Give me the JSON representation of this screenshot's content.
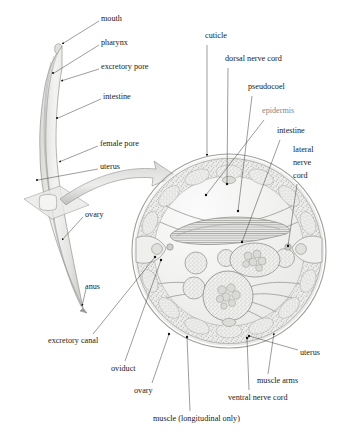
{
  "figure": {
    "background_color": "#ffffff",
    "ink_color": "#1a1a1a",
    "tissue_fill": "#e8e8e6",
    "tissue_stroke": "#9a9a98",
    "pale_fill": "#f2f2f0"
  },
  "whole_worm": {
    "name": "female-nematode-whole-body",
    "cut_plane_label": "transverse cut plane",
    "labels": [
      {
        "id": "mouth",
        "text": "mouth",
        "x": 101,
        "y": 19,
        "anchor": "start",
        "tip_x": 58,
        "tip_y": 47,
        "arrow": true
      },
      {
        "id": "pharynx",
        "text": "pharynx",
        "x": 101,
        "y": 43,
        "anchor": "start",
        "tip_x": 53,
        "tip_y": 74,
        "arrow": false
      },
      {
        "id": "excretory-pore",
        "text": "excretory pore",
        "x": 101,
        "y": 67,
        "anchor": "start",
        "tip_x": 58,
        "tip_y": 82,
        "arrow": true
      },
      {
        "id": "intestine",
        "text": "intestine",
        "x": 103,
        "y": 97,
        "anchor": "start",
        "tip_x": 57,
        "tip_y": 117,
        "arrow": false
      },
      {
        "id": "female-pore",
        "text": "female pore",
        "x": 100,
        "y": 144,
        "anchor": "start",
        "tip_x": 56,
        "tip_y": 163,
        "arrow": true
      },
      {
        "id": "uterus",
        "text": "uterus",
        "x": 100,
        "y": 167,
        "anchor": "start",
        "tip_x": 37,
        "tip_y": 180,
        "arrow": false
      },
      {
        "id": "ovary",
        "text": "ovary",
        "x": 85,
        "y": 215,
        "anchor": "start",
        "tip_x": 60,
        "tip_y": 241,
        "arrow": true
      },
      {
        "id": "anus",
        "text": "anus",
        "x": 85,
        "y": 287,
        "anchor": "start",
        "tip_x": 80,
        "tip_y": 307,
        "arrow": true
      }
    ]
  },
  "cross_section": {
    "name": "nematode-transverse-section",
    "center_x": 229,
    "center_y": 251,
    "radius": 97,
    "structures": [
      "cuticle",
      "epidermis",
      "muscle (longitudinal only)",
      "muscle arms",
      "dorsal nerve cord",
      "ventral nerve cord",
      "lateral nerve cord",
      "pseudocoel",
      "intestine",
      "uterus",
      "ovary",
      "oviduct",
      "excretory canal"
    ],
    "labels": [
      {
        "id": "cuticle",
        "text": "cuticle",
        "x": 205,
        "y": 36,
        "anchor": "start",
        "lines": [
          "cuticle"
        ],
        "tip_x": 207,
        "tip_y": 160,
        "arrow": true
      },
      {
        "id": "dorsal-nerve-cord",
        "text": "dorsal nerve cord",
        "x": 225,
        "y": 59,
        "anchor": "start",
        "lines": [
          "dorsal nerve cord"
        ],
        "tip_x": 226,
        "tip_y": 185,
        "arrow": false
      },
      {
        "id": "pseudocoel",
        "text": "pseudocoel",
        "x": 248,
        "y": 87,
        "anchor": "start",
        "lines": [
          "pseudocoel"
        ],
        "tip_x": 237,
        "tip_y": 212,
        "arrow": false
      },
      {
        "id": "epidermis",
        "text": "epidermis",
        "x": 262,
        "y": 111,
        "anchor": "start",
        "lines": [
          "epidermis"
        ],
        "tip_x": 205,
        "tip_y": 196,
        "arrow": false,
        "blurred": true
      },
      {
        "id": "intestine",
        "text": "intestine",
        "x": 277,
        "y": 131,
        "anchor": "start",
        "lines": [
          "intestine"
        ],
        "tip_x": 241,
        "tip_y": 243,
        "arrow": false
      },
      {
        "id": "lateral-nerve-cord",
        "text": "lateral nerve cord",
        "x": 293,
        "y": 150,
        "anchor": "start",
        "lines": [
          "lateral",
          "nerve",
          "cord"
        ],
        "tip_x": 287,
        "tip_y": 247,
        "arrow": false
      },
      {
        "id": "uterus",
        "text": "uterus",
        "x": 300,
        "y": 353,
        "anchor": "start",
        "lines": [
          "uterus"
        ],
        "tip_x": 248,
        "tip_y": 336,
        "arrow": false
      },
      {
        "id": "muscle-arms",
        "text": "muscle arms",
        "x": 257,
        "y": 381,
        "anchor": "start",
        "lines": [
          "muscle arms"
        ],
        "tip_x": 272,
        "tip_y": 334,
        "arrow": true
      },
      {
        "id": "ventral-nerve-cord",
        "text": "ventral nerve cord",
        "x": 228,
        "y": 398,
        "anchor": "start",
        "lines": [
          "ventral nerve cord"
        ],
        "tip_x": 246,
        "tip_y": 339,
        "arrow": false
      },
      {
        "id": "muscle-longitudinal",
        "text": "muscle (longitudinal only)",
        "x": 153,
        "y": 419,
        "anchor": "start",
        "lines": [
          "muscle (longitudinal only)"
        ],
        "tip_x": 186,
        "tip_y": 338,
        "arrow": false
      },
      {
        "id": "ovary",
        "text": "ovary",
        "x": 134,
        "y": 391,
        "anchor": "start",
        "lines": [
          "ovary"
        ],
        "tip_x": 168,
        "tip_y": 335,
        "arrow": false
      },
      {
        "id": "oviduct",
        "text": "oviduct",
        "x": 111,
        "y": 369,
        "anchor": "start",
        "lines": [
          "oviduct"
        ],
        "tip_x": 160,
        "tip_y": 259,
        "arrow": false
      },
      {
        "id": "excretory-canal",
        "text": "excretory canal",
        "x": 48,
        "y": 341,
        "anchor": "start",
        "lines": [
          "excretory canal"
        ],
        "tip_x": 154,
        "tip_y": 258,
        "arrow": false
      }
    ]
  }
}
